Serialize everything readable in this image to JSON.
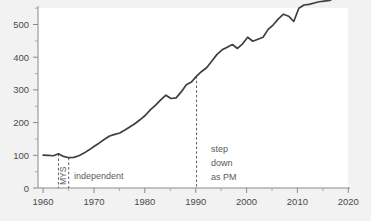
{
  "chart_data": {
    "type": "line",
    "title": "",
    "xlabel": "",
    "ylabel": "",
    "xlim": [
      1959,
      2020
    ],
    "ylim": [
      0,
      553
    ],
    "grid": false,
    "legend": "none",
    "x_ticks": [
      "1960",
      "1970",
      "1980",
      "1990",
      "2000",
      "2010",
      "2020"
    ],
    "x_tick_values": [
      1960,
      1970,
      1980,
      1990,
      2000,
      2010,
      2020
    ],
    "x_minor_tick_values": [
      1965,
      1975,
      1985,
      1995,
      2005,
      2015
    ],
    "y_ticks": [
      "0",
      "100",
      "200",
      "300",
      "400",
      "500"
    ],
    "y_tick_values": [
      0,
      100,
      200,
      300,
      400,
      500
    ],
    "y_minor_tick_values": [
      50,
      150,
      250,
      350,
      450,
      550
    ],
    "series": [
      {
        "name": "index",
        "color": "#3f3f42",
        "x": [
          1960,
          1961,
          1962,
          1963,
          1964,
          1965,
          1966,
          1967,
          1968,
          1969,
          1970,
          1971,
          1972,
          1973,
          1974,
          1975,
          1976,
          1977,
          1978,
          1979,
          1980,
          1981,
          1982,
          1983,
          1984,
          1985,
          1986,
          1987,
          1988,
          1989,
          1990,
          1991,
          1992,
          1993,
          1994,
          1995,
          1996,
          1997,
          1998,
          1999,
          2000,
          2001,
          2002,
          2003,
          2004,
          2005,
          2006,
          2007,
          2008,
          2009,
          2010,
          2011,
          2012,
          2013,
          2014,
          2015,
          2016,
          2017,
          2018,
          2019
        ],
        "values": [
          100,
          99,
          98,
          104,
          96,
          92,
          93,
          98,
          106,
          116,
          127,
          137,
          148,
          158,
          163,
          167,
          176,
          186,
          196,
          208,
          221,
          238,
          252,
          268,
          282,
          272,
          274,
          292,
          314,
          322,
          340,
          354,
          366,
          386,
          406,
          420,
          428,
          436,
          424,
          438,
          458,
          446,
          452,
          458,
          482,
          496,
          514,
          528,
          522,
          506,
          546,
          556,
          558,
          562,
          566,
          568,
          570,
          578,
          580,
          576
        ],
        "value_scale_note": "index, 1960 = 100"
      }
    ],
    "annotations": [
      {
        "name": "federation-period-start",
        "type": "vline",
        "x": 1963,
        "label": "MYS",
        "label_rotation": -90
      },
      {
        "name": "independence",
        "type": "vline",
        "x": 1965,
        "label": "independent",
        "label_rotation": 0
      },
      {
        "name": "pm-step-down",
        "type": "vline",
        "x": 1990,
        "label": "step\ndown\nas PM",
        "label_lines": [
          "step",
          "down",
          "as PM"
        ],
        "label_rotation": 0
      }
    ],
    "colors": {
      "line": "#3f3f42",
      "axis": "#8a8a8a",
      "text": "#4a4a4a",
      "annotation_text": "#5b5b5b",
      "event_line": "#5c5c5c",
      "plot_background": "#ffffff",
      "figure_background": "#f2f2f2"
    }
  }
}
